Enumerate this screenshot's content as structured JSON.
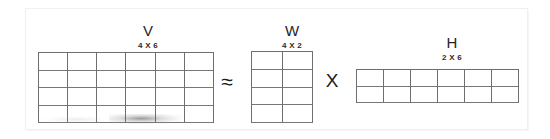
{
  "figure": {
    "kind": "matrix-factorization-diagram",
    "equation_text": "V ≈ W X H",
    "background_color": "#ffffff",
    "frame_color": "#f0f0f0",
    "grid_line_color": "#6e6e6e",
    "text_color": "#262626"
  },
  "matrices": [
    {
      "id": "v",
      "label": "V",
      "dims_label": "4 X 6",
      "rows": 4,
      "cols": 6
    },
    {
      "id": "w",
      "label": "W",
      "dims_label": "4 X 2",
      "rows": 4,
      "cols": 2
    },
    {
      "id": "h",
      "label": "H",
      "dims_label": "2 X 6",
      "rows": 2,
      "cols": 6
    }
  ],
  "operators": {
    "approx": "≈",
    "approx_name": "approximately-equal",
    "times": "X",
    "times_name": "multiplication"
  }
}
